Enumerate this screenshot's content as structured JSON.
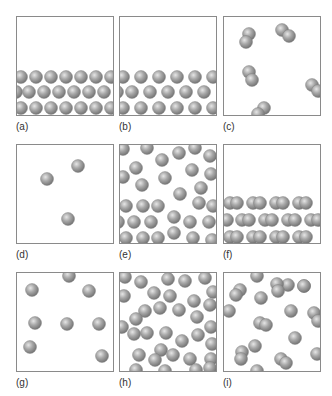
{
  "figure": {
    "ball_color": "#9c9c9c",
    "ball_radius": 6.5,
    "panels": [
      {
        "id": "a",
        "label": "(a)",
        "x": 16,
        "y": 16,
        "atoms": [
          [
            4,
            60
          ],
          [
            19,
            60
          ],
          [
            34,
            60
          ],
          [
            49,
            60
          ],
          [
            64,
            60
          ],
          [
            79,
            60
          ],
          [
            94,
            60
          ],
          [
            -1,
            75
          ],
          [
            12,
            75
          ],
          [
            27,
            75
          ],
          [
            42,
            75
          ],
          [
            57,
            75
          ],
          [
            72,
            75
          ],
          [
            87,
            75
          ],
          [
            4,
            91
          ],
          [
            19,
            91
          ],
          [
            34,
            91
          ],
          [
            49,
            91
          ],
          [
            64,
            91
          ],
          [
            79,
            91
          ],
          [
            94,
            91
          ]
        ],
        "molecules": []
      },
      {
        "id": "b",
        "label": "(b)",
        "x": 119,
        "y": 16,
        "atoms": [
          [
            3,
            60
          ],
          [
            21,
            60
          ],
          [
            39,
            60
          ],
          [
            57,
            60
          ],
          [
            75,
            60
          ],
          [
            93,
            60
          ],
          [
            -3,
            75
          ],
          [
            12,
            75
          ],
          [
            30,
            75
          ],
          [
            48,
            75
          ],
          [
            66,
            75
          ],
          [
            84,
            75
          ],
          [
            3,
            91
          ],
          [
            21,
            91
          ],
          [
            39,
            91
          ],
          [
            57,
            91
          ],
          [
            75,
            91
          ],
          [
            93,
            91
          ]
        ],
        "molecules": []
      },
      {
        "id": "c",
        "label": "(c)",
        "x": 223,
        "y": 16,
        "atoms": [],
        "molecules": [
          [
            25,
            17,
            22,
            25
          ],
          [
            58,
            13,
            65,
            19
          ],
          [
            25,
            55,
            28,
            63
          ],
          [
            88,
            68,
            94,
            74
          ],
          [
            40,
            91,
            34,
            97
          ]
        ]
      },
      {
        "id": "d",
        "label": "(d)",
        "x": 16,
        "y": 144,
        "atoms": [
          [
            30,
            34
          ],
          [
            61,
            21
          ],
          [
            51,
            74
          ]
        ],
        "molecules": []
      },
      {
        "id": "e",
        "label": "(e)",
        "x": 119,
        "y": 144,
        "atoms": [
          [
            3,
            4
          ],
          [
            27,
            3
          ],
          [
            42,
            15
          ],
          [
            59,
            8
          ],
          [
            75,
            3
          ],
          [
            90,
            11
          ],
          [
            16,
            23
          ],
          [
            3,
            32
          ],
          [
            45,
            33
          ],
          [
            72,
            25
          ],
          [
            91,
            29
          ],
          [
            22,
            40
          ],
          [
            81,
            43
          ],
          [
            60,
            49
          ],
          [
            6,
            61
          ],
          [
            23,
            61
          ],
          [
            38,
            61
          ],
          [
            79,
            58
          ],
          [
            93,
            61
          ],
          [
            54,
            72
          ],
          [
            -2,
            77
          ],
          [
            14,
            77
          ],
          [
            31,
            77
          ],
          [
            70,
            77
          ],
          [
            89,
            77
          ],
          [
            6,
            93
          ],
          [
            23,
            93
          ],
          [
            38,
            93
          ],
          [
            54,
            88
          ],
          [
            73,
            93
          ],
          [
            92,
            95
          ]
        ],
        "molecules": []
      },
      {
        "id": "f",
        "label": "(f)",
        "x": 223,
        "y": 144,
        "atoms": [],
        "molecules": [
          [
            6,
            58,
            13,
            58
          ],
          [
            29,
            58,
            36,
            58
          ],
          [
            52,
            58,
            59,
            58
          ],
          [
            75,
            58,
            82,
            58
          ],
          [
            -4,
            75,
            3,
            75
          ],
          [
            18,
            75,
            25,
            75
          ],
          [
            41,
            75,
            48,
            75
          ],
          [
            64,
            75,
            71,
            75
          ],
          [
            87,
            75,
            94,
            75
          ],
          [
            6,
            92,
            13,
            92
          ],
          [
            29,
            92,
            36,
            92
          ],
          [
            52,
            92,
            59,
            92
          ],
          [
            75,
            92,
            82,
            92
          ]
        ]
      },
      {
        "id": "g",
        "label": "(g)",
        "x": 16,
        "y": 272,
        "atoms": [
          [
            52,
            3
          ],
          [
            15,
            17
          ],
          [
            72,
            18
          ],
          [
            18,
            50
          ],
          [
            50,
            51
          ],
          [
            82,
            51
          ],
          [
            13,
            74
          ],
          [
            85,
            83
          ]
        ],
        "molecules": []
      },
      {
        "id": "h",
        "label": "(h)",
        "x": 119,
        "y": 272,
        "atoms": [
          [
            5,
            4
          ],
          [
            21,
            9
          ],
          [
            48,
            6
          ],
          [
            65,
            8
          ],
          [
            85,
            5
          ],
          [
            93,
            19
          ],
          [
            4,
            23
          ],
          [
            34,
            20
          ],
          [
            50,
            23
          ],
          [
            74,
            28
          ],
          [
            90,
            32
          ],
          [
            25,
            38
          ],
          [
            40,
            35
          ],
          [
            59,
            37
          ],
          [
            16,
            46
          ],
          [
            77,
            44
          ],
          [
            2,
            54
          ],
          [
            91,
            54
          ],
          [
            46,
            60
          ],
          [
            14,
            61
          ],
          [
            27,
            60
          ],
          [
            62,
            68
          ],
          [
            78,
            62
          ],
          [
            92,
            71
          ],
          [
            41,
            77
          ],
          [
            19,
            82
          ],
          [
            35,
            87
          ],
          [
            53,
            82
          ],
          [
            70,
            86
          ],
          [
            91,
            86
          ],
          [
            16,
            97
          ],
          [
            45,
            98
          ],
          [
            76,
            97
          ],
          [
            90,
            95
          ]
        ],
        "molecules": []
      },
      {
        "id": "i",
        "label": "(i)",
        "x": 223,
        "y": 272,
        "atoms": [
          [
            33,
            3
          ],
          [
            64,
            12
          ],
          [
            37,
            25
          ],
          [
            5,
            38
          ],
          [
            67,
            38
          ],
          [
            71,
            65
          ],
          [
            31,
            73
          ],
          [
            33,
            98
          ],
          [
            93,
            81
          ]
        ],
        "molecules": [
          [
            16,
            17,
            12,
            22
          ],
          [
            53,
            11,
            54,
            18
          ],
          [
            36,
            50,
            42,
            52
          ],
          [
            90,
            40,
            94,
            48
          ],
          [
            18,
            79,
            17,
            86
          ],
          [
            57,
            86,
            62,
            90
          ],
          [
            80,
            13,
            80,
            13
          ]
        ]
      }
    ]
  }
}
